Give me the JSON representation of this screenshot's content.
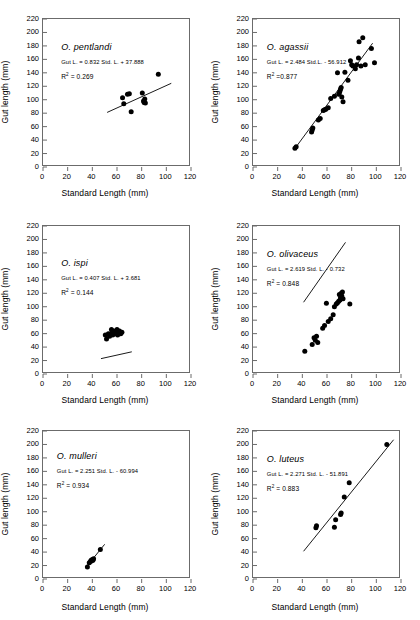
{
  "axes": {
    "xlabel": "Standard Length (mm)",
    "ylabel": "Gut length (mm)",
    "xticks": [
      "0",
      "20",
      "40",
      "60",
      "80",
      "100",
      "120"
    ],
    "yticks": [
      "0",
      "20",
      "40",
      "60",
      "80",
      "100",
      "120",
      "140",
      "160",
      "180",
      "200",
      "220"
    ],
    "xlim": [
      0,
      120
    ],
    "ylim": [
      0,
      220
    ]
  },
  "style": {
    "marker_color": "#000000",
    "line_color": "#000000",
    "frame_color": "#6b6b6b"
  },
  "chart_data": [
    {
      "type": "scatter",
      "id": "pentlandi",
      "species": "O. pentlandi",
      "equation": "Gut L. = 0.832 Std. L. + 37.888",
      "r2_label": "R",
      "r2_exp": "2",
      "r2_value": "= 0.269",
      "slope": 0.832,
      "intercept": 37.888,
      "r2": 0.269,
      "xlabel": "Standard Length (mm)",
      "ylabel": "Gut length (mm)",
      "xlim": [
        0,
        120
      ],
      "ylim": [
        0,
        220
      ],
      "fit_x": [
        52,
        104
      ],
      "points": [
        [
          64.5,
          103
        ],
        [
          65.5,
          94
        ],
        [
          68.5,
          108
        ],
        [
          70,
          109
        ],
        [
          71.5,
          82
        ],
        [
          80.5,
          110
        ],
        [
          81.5,
          98
        ],
        [
          82,
          96
        ],
        [
          82.5,
          101
        ],
        [
          83,
          95
        ],
        [
          93.5,
          138
        ]
      ]
    },
    {
      "type": "scatter",
      "id": "agassii",
      "species": "O. agassii",
      "equation": "Gut L. = 2.484 Std.L. - 56.912",
      "r2_label": "R",
      "r2_exp": "2",
      "r2_value": "=0.877",
      "slope": 2.484,
      "intercept": -56.912,
      "r2": 0.877,
      "xlabel": "Standard Length (mm)",
      "ylabel": "Gut length (mm)",
      "xlim": [
        0,
        120
      ],
      "ylim": [
        0,
        220
      ],
      "fit_x": [
        34,
        97
      ],
      "points": [
        [
          34,
          28
        ],
        [
          35,
          30
        ],
        [
          47.5,
          52
        ],
        [
          48,
          55
        ],
        [
          48.5,
          58
        ],
        [
          53,
          70
        ],
        [
          54.5,
          72
        ],
        [
          57,
          84
        ],
        [
          58,
          85
        ],
        [
          59,
          86
        ],
        [
          61,
          88
        ],
        [
          63,
          102
        ],
        [
          66,
          105
        ],
        [
          68.5,
          140
        ],
        [
          69.5,
          108
        ],
        [
          70,
          110
        ],
        [
          70.5,
          113
        ],
        [
          71,
          116
        ],
        [
          71.5,
          118
        ],
        [
          72,
          104
        ],
        [
          73,
          97
        ],
        [
          74.5,
          141
        ],
        [
          77,
          129
        ],
        [
          79,
          158
        ],
        [
          80,
          152
        ],
        [
          81,
          150
        ],
        [
          83,
          146
        ],
        [
          84,
          152
        ],
        [
          85.5,
          162
        ],
        [
          86,
          186
        ],
        [
          87.5,
          150
        ],
        [
          89,
          192
        ],
        [
          91,
          152
        ],
        [
          96,
          176
        ],
        [
          98.5,
          155
        ]
      ]
    },
    {
      "type": "scatter",
      "id": "ispi",
      "species": "O. ispi",
      "equation": "Gut L. = 0.407 Std. L. + 3.681",
      "r2_label": "R",
      "r2_exp": "2",
      "r2_value": "= 0.144",
      "slope": 0.407,
      "intercept": 3.681,
      "r2": 0.144,
      "xlabel": "Standard Length (mm)",
      "ylabel": "Gut length (mm)",
      "xlim": [
        0,
        120
      ],
      "ylim": [
        0,
        220
      ],
      "fit_x": [
        47,
        72
      ],
      "points": [
        [
          50.5,
          58
        ],
        [
          51.5,
          52
        ],
        [
          53,
          60
        ],
        [
          54,
          56
        ],
        [
          55.5,
          66
        ],
        [
          56,
          62
        ],
        [
          56.5,
          58
        ],
        [
          57.5,
          64
        ],
        [
          58,
          60
        ],
        [
          59,
          62
        ],
        [
          60,
          66
        ],
        [
          60.5,
          58
        ],
        [
          61,
          62
        ],
        [
          62,
          64
        ],
        [
          63,
          60
        ],
        [
          64,
          62
        ]
      ]
    },
    {
      "type": "scatter",
      "id": "olivaceus",
      "species": "O. olivaceus",
      "equation": "Gut L. = 2.619 Std. L. - 0.732",
      "r2_label": "R",
      "r2_exp": "2",
      "r2_value": "= 0.848",
      "slope": 2.619,
      "intercept": -0.732,
      "r2": 0.848,
      "xlabel": "Standard Length (mm)",
      "ylabel": "Gut length (mm)",
      "xlim": [
        0,
        120
      ],
      "ylim": [
        0,
        220
      ],
      "fit_x": [
        41,
        75
      ],
      "points": [
        [
          42,
          34
        ],
        [
          48,
          44
        ],
        [
          49.5,
          54
        ],
        [
          50.5,
          50
        ],
        [
          51.5,
          56
        ],
        [
          52.5,
          47
        ],
        [
          56.5,
          68
        ],
        [
          58,
          72
        ],
        [
          59.5,
          105
        ],
        [
          61,
          78
        ],
        [
          63,
          82
        ],
        [
          65,
          88
        ],
        [
          66,
          100
        ],
        [
          67.5,
          104
        ],
        [
          68.5,
          106
        ],
        [
          69.5,
          108
        ],
        [
          70,
          118
        ],
        [
          70.5,
          110
        ],
        [
          71,
          114
        ],
        [
          71.5,
          120
        ],
        [
          72,
          116
        ],
        [
          72.5,
          122
        ],
        [
          73,
          112
        ],
        [
          78.5,
          104
        ]
      ]
    },
    {
      "type": "scatter",
      "id": "mulleri",
      "species": "O. mulleri",
      "equation": "Gut L. = 2.251 Std. L. - 60.994",
      "r2_label": "R",
      "r2_exp": "2",
      "r2_value": "= 0.934",
      "slope": 2.251,
      "intercept": -60.994,
      "r2": 0.934,
      "xlabel": "Standard Length (mm)",
      "ylabel": "Gut length (mm)",
      "xlim": [
        0,
        120
      ],
      "ylim": [
        0,
        220
      ],
      "fit_x": [
        35,
        50
      ],
      "points": [
        [
          36,
          18
        ],
        [
          37.5,
          24
        ],
        [
          38.5,
          26
        ],
        [
          39,
          28
        ],
        [
          39.5,
          27
        ],
        [
          40,
          29
        ],
        [
          40.5,
          28
        ],
        [
          41,
          30
        ],
        [
          46.5,
          44
        ]
      ]
    },
    {
      "type": "scatter",
      "id": "luteus",
      "species": "O. luteus",
      "equation": "Gut L. = 2.271 Std. L. - 51.891",
      "r2_label": "R",
      "r2_exp": "2",
      "r2_value": "= 0.883",
      "slope": 2.271,
      "intercept": -51.891,
      "r2": 0.883,
      "xlabel": "Standard Length (mm)",
      "ylabel": "Gut length (mm)",
      "xlim": [
        0,
        120
      ],
      "ylim": [
        0,
        220
      ],
      "fit_x": [
        41,
        114
      ],
      "points": [
        [
          51,
          76
        ],
        [
          51.5,
          79
        ],
        [
          66,
          77
        ],
        [
          67,
          88
        ],
        [
          71,
          96
        ],
        [
          71.5,
          98
        ],
        [
          74,
          122
        ],
        [
          78,
          143
        ],
        [
          108.5,
          200
        ]
      ]
    }
  ]
}
